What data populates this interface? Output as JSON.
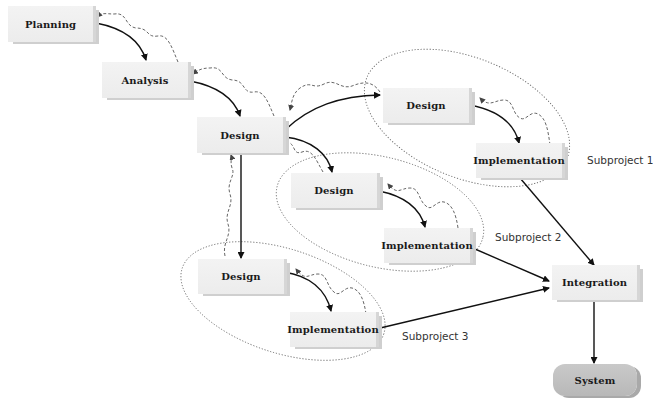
{
  "diagram": {
    "title": "",
    "colors": {
      "box_fill": "#efefef",
      "box_edge": "#d6d6d6",
      "system_fill": "#c0c0c0",
      "arrow": "#111111",
      "feedback": "#555555",
      "group_outline": "#777777"
    },
    "nodes": {
      "planning": "Planning",
      "analysis": "Analysis",
      "design_main": "Design",
      "design_sp1": "Design",
      "impl_sp1": "Implementation",
      "design_sp2": "Design",
      "impl_sp2": "Implementation",
      "design_sp3": "Design",
      "impl_sp3": "Implementation",
      "integration": "Integration",
      "system": "System"
    },
    "groups": {
      "sp1": "Subproject 1",
      "sp2": "Subproject 2",
      "sp3": "Subproject 3"
    },
    "edges": [
      {
        "from": "Planning",
        "to": "Analysis",
        "type": "flow"
      },
      {
        "from": "Analysis",
        "to": "Planning",
        "type": "feedback"
      },
      {
        "from": "Analysis",
        "to": "Design",
        "type": "flow"
      },
      {
        "from": "Design",
        "to": "Analysis",
        "type": "feedback"
      },
      {
        "from": "Design",
        "to": "Design (Subproject 1)",
        "type": "flow"
      },
      {
        "from": "Design (Subproject 1)",
        "to": "Design",
        "type": "feedback"
      },
      {
        "from": "Design",
        "to": "Design (Subproject 2)",
        "type": "flow"
      },
      {
        "from": "Design (Subproject 2)",
        "to": "Design",
        "type": "feedback"
      },
      {
        "from": "Design",
        "to": "Design (Subproject 3)",
        "type": "flow"
      },
      {
        "from": "Design (Subproject 3)",
        "to": "Design",
        "type": "feedback"
      },
      {
        "from": "Design (Subproject 1)",
        "to": "Implementation (Subproject 1)",
        "type": "flow"
      },
      {
        "from": "Implementation (Subproject 1)",
        "to": "Design (Subproject 1)",
        "type": "feedback"
      },
      {
        "from": "Design (Subproject 2)",
        "to": "Implementation (Subproject 2)",
        "type": "flow"
      },
      {
        "from": "Implementation (Subproject 2)",
        "to": "Design (Subproject 2)",
        "type": "feedback"
      },
      {
        "from": "Design (Subproject 3)",
        "to": "Implementation (Subproject 3)",
        "type": "flow"
      },
      {
        "from": "Implementation (Subproject 3)",
        "to": "Design (Subproject 3)",
        "type": "feedback"
      },
      {
        "from": "Implementation (Subproject 1)",
        "to": "Integration",
        "type": "flow"
      },
      {
        "from": "Implementation (Subproject 2)",
        "to": "Integration",
        "type": "flow"
      },
      {
        "from": "Implementation (Subproject 3)",
        "to": "Integration",
        "type": "flow"
      },
      {
        "from": "Integration",
        "to": "System",
        "type": "flow"
      }
    ]
  }
}
